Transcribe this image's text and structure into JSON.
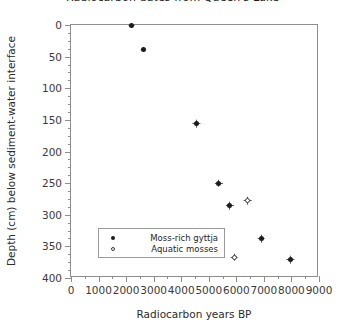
{
  "chart_data": {
    "type": "scatter",
    "title": "Radiocarbon dates from Queen's Lake",
    "xlabel": "Radiocarbon years BP",
    "ylabel": "Depth (cm) below sediment-water interface",
    "xlim": [
      0,
      9000
    ],
    "ylim": [
      400,
      0
    ],
    "y_inverted": true,
    "grid": false,
    "xticks": [
      0,
      1000,
      2000,
      3000,
      4000,
      5000,
      6000,
      7000,
      8000,
      9000
    ],
    "xticklabels": [
      "0",
      "1000",
      "2000",
      "3000",
      "4000",
      "5000",
      "6000",
      "7000",
      "8000",
      "9000"
    ],
    "xminor_interval": 500,
    "yticks": [
      0,
      50,
      100,
      150,
      200,
      250,
      300,
      350,
      400
    ],
    "yticklabels": [
      "0",
      "50",
      "100",
      "150",
      "200",
      "250",
      "300",
      "350",
      "400"
    ],
    "yminor_interval": 12.5,
    "legend_position": "lower left",
    "series": [
      {
        "name": "Moss-rich gyttja",
        "marker": "filled-circle",
        "color": "#1c1c1c",
        "points": [
          {
            "x": 2180,
            "y": 0,
            "xerr": 110,
            "yerr": 4
          },
          {
            "x": 2620,
            "y": 38,
            "xerr": 100,
            "yerr": 4
          },
          {
            "x": 4540,
            "y": 156,
            "xerr": 150,
            "yerr": 6
          },
          {
            "x": 5370,
            "y": 250,
            "xerr": 130,
            "yerr": 6
          },
          {
            "x": 5770,
            "y": 286,
            "xerr": 130,
            "yerr": 6
          },
          {
            "x": 6900,
            "y": 338,
            "xerr": 140,
            "yerr": 6
          },
          {
            "x": 7950,
            "y": 371,
            "xerr": 150,
            "yerr": 6
          }
        ]
      },
      {
        "name": "Aquatic mosses",
        "marker": "open-circle",
        "color": "#3a3a3a",
        "points": [
          {
            "x": 6420,
            "y": 278,
            "xerr": 140,
            "yerr": 6
          },
          {
            "x": 5920,
            "y": 367,
            "xerr": 140,
            "yerr": 6
          }
        ]
      }
    ]
  },
  "legend": {
    "entries": [
      {
        "label": "Moss-rich gyttja",
        "marker": "filled-circle"
      },
      {
        "label": "Aquatic mosses",
        "marker": "open-circle"
      }
    ]
  }
}
